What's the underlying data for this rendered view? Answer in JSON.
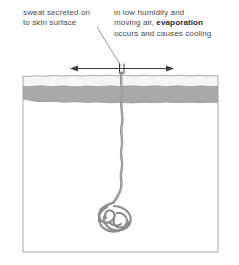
{
  "diagram": {
    "labels": {
      "left": {
        "line1": "sweat secreted on",
        "line2": "to skin surface"
      },
      "right": {
        "line1": "in low humidity and",
        "line2_pre": "moving air, ",
        "line2_bold": "evaporation",
        "line3": "occurs and causes cooling"
      }
    },
    "colors": {
      "text": "#4a4a4a",
      "text_bold": "#2b2b2b",
      "epidermis": "#f5f5f5",
      "dermis": "#a9a9a9",
      "hypodermis": "#ffffff",
      "duct": "#8c8c8c",
      "outline": "#9a9a9a",
      "arrow": "#3c3c3c",
      "leader": "#8a8a8a"
    },
    "parts": {
      "epidermis_name": "epidermis-layer",
      "dermis_name": "dermis-layer",
      "hypodermis_name": "hypodermis-layer",
      "duct_name": "sweat-duct",
      "coil_name": "sweat-gland-coil",
      "pore_name": "skin-pore",
      "arrow_name": "evaporation-arrow",
      "leader_name": "leader-line"
    }
  }
}
